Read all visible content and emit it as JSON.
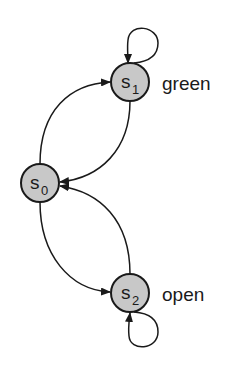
{
  "diagram": {
    "type": "state-transition",
    "states": [
      {
        "id": "s0",
        "name": "s",
        "sub": "0",
        "label": ""
      },
      {
        "id": "s1",
        "name": "s",
        "sub": "1",
        "label": "green"
      },
      {
        "id": "s2",
        "name": "s",
        "sub": "2",
        "label": "open"
      }
    ],
    "transitions": [
      {
        "from": "s0",
        "to": "s1"
      },
      {
        "from": "s1",
        "to": "s0"
      },
      {
        "from": "s0",
        "to": "s2"
      },
      {
        "from": "s2",
        "to": "s0"
      },
      {
        "from": "s1",
        "to": "s1"
      },
      {
        "from": "s2",
        "to": "s2"
      }
    ],
    "colors": {
      "node_fill": "#c8c8c8",
      "stroke": "#1a1a1a"
    }
  }
}
